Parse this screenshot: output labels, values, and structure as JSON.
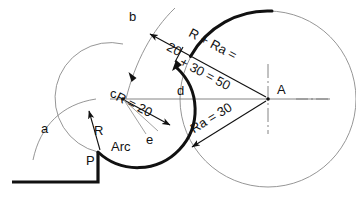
{
  "drawing": {
    "title": "Tangent arc construction",
    "stroke_color": "#111111",
    "thin_color": "#6b6b6b",
    "center_line_color": "#555555",
    "background": "#ffffff"
  },
  "labels": {
    "point_b": "b",
    "point_c": "c",
    "point_d": "d",
    "point_a": "a",
    "point_e": "e",
    "point_P": "P",
    "center_A": "A",
    "radius_R": "R",
    "arc_text": "Arc",
    "dim_R20": "R = 20",
    "dim_Ra30": "Ra = 30",
    "dim_sum_line1": "R + Ra =",
    "dim_sum_line2": "20 + 30 = 50",
    "dim_sum_part1": "20",
    "dim_sum_part2": "+ 30 = 50",
    "dim_sum_head": "R + Ra ="
  },
  "values": {
    "R": 20,
    "Ra": 30,
    "R_plus_Ra": 50
  },
  "geometry": {
    "center_A": [
      268,
      99
    ],
    "center_c": [
      123,
      99
    ],
    "point_P": [
      98,
      152
    ],
    "big_circle_radius": 88,
    "small_arc_radius": 55
  }
}
